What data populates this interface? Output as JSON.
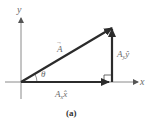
{
  "figure": {
    "caption": "(a)",
    "axes": {
      "x_label": "x",
      "y_label": "y"
    },
    "vectors": {
      "resultant": {
        "label": "A",
        "arrow": "→"
      },
      "x_component": {
        "label": "A",
        "sub": "x",
        "unit": "x̂"
      },
      "y_component": {
        "label": "A",
        "sub": "y",
        "unit": "ŷ"
      }
    },
    "angle_label": "θ",
    "colors": {
      "vector": "#2b2b2b",
      "axis": "#8a8a8a",
      "label": "#6a6a6a"
    }
  }
}
